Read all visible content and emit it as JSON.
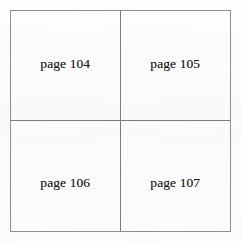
{
  "document": {
    "type": "scanned-page-grid",
    "background_color": "#fdfdfd",
    "border_color": "#8e8e8e",
    "divider_color": "#7d7d7d",
    "text_color": "#1b1b1b"
  },
  "grid": {
    "rows": 2,
    "columns": 2,
    "cells": [
      {
        "label": "page 104",
        "row": 1,
        "column": 1
      },
      {
        "label": "page 105",
        "row": 1,
        "column": 2
      },
      {
        "label": "page 106",
        "row": 2,
        "column": 1
      },
      {
        "label": "page 107",
        "row": 2,
        "column": 2
      }
    ]
  }
}
